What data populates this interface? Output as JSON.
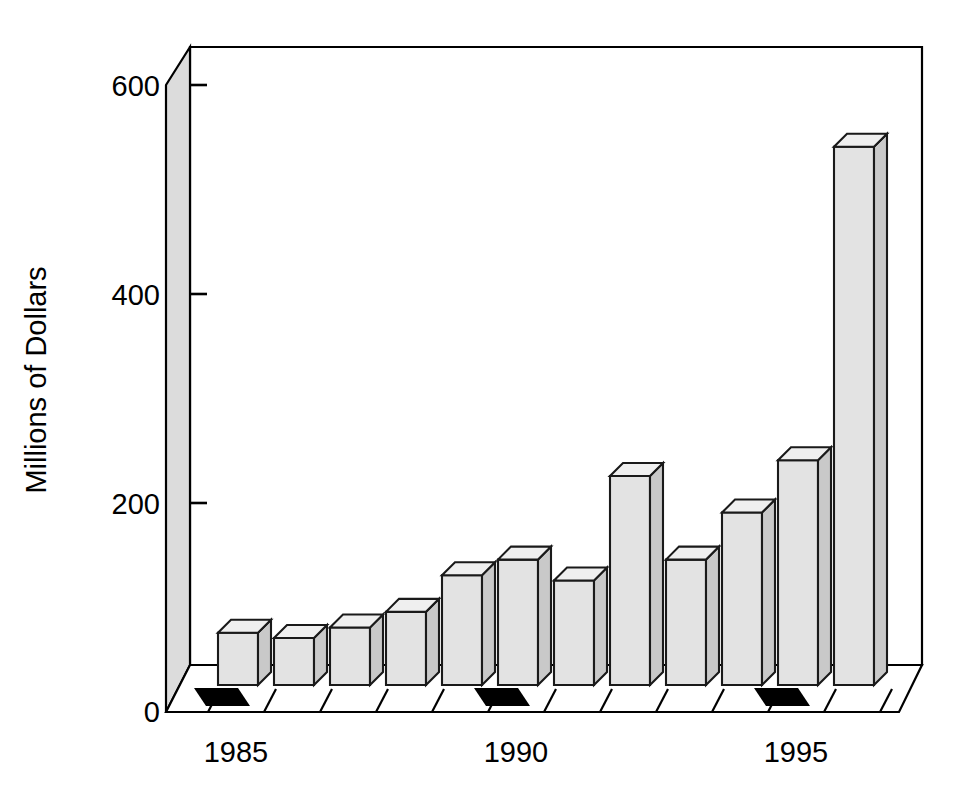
{
  "chart_data": {
    "type": "bar",
    "title": "",
    "subtitle": "",
    "xlabel": "",
    "ylabel": "Millions of Dollars",
    "categories": [
      "1985",
      "1986",
      "1987",
      "1988",
      "1989",
      "1990",
      "1991",
      "1992",
      "1993",
      "1994",
      "1995",
      "1996"
    ],
    "values": [
      95,
      90,
      100,
      115,
      150,
      165,
      145,
      245,
      165,
      210,
      260,
      560
    ],
    "ylim": [
      0,
      640
    ],
    "ytick_values": [
      0,
      200,
      400,
      600
    ],
    "ytick_labels": [
      "0",
      "200",
      "400",
      "600"
    ],
    "xtick_labels_shown": [
      "1985",
      "1990",
      "1995"
    ],
    "xtick_label_indices": [
      0,
      5,
      10
    ],
    "grid": false,
    "legend": null,
    "style": "3d-perspective-bars",
    "bar_face_color": "#e3e3e3",
    "bar_top_color": "#efefef",
    "bar_side_color": "#c9c9c9",
    "bar_edge_color": "#1a1a1a",
    "wall_color": "#dcdcdc",
    "floor_color": "#ffffff",
    "axis_color": "#000000",
    "highlight_tick_color": "#000000"
  },
  "axis": {
    "y_title": "Millions of Dollars",
    "y_labels": {
      "t0": "0",
      "t200": "200",
      "t400": "400",
      "t600": "600"
    },
    "x_labels": {
      "l1985": "1985",
      "l1990": "1990",
      "l1995": "1995"
    }
  }
}
